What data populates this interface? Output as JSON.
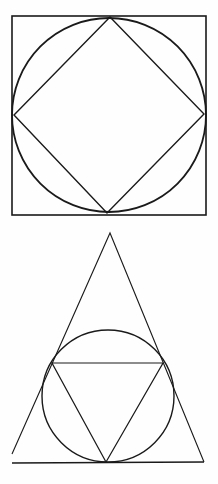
{
  "diagram": {
    "width": 218,
    "height": 484,
    "stroke_color": "#1a1a1a",
    "background": "#fefefe",
    "figures": [
      {
        "name": "square-circle-diamond",
        "description": "Circle inscribed in a square, with a square (diamond) inscribed in the circle",
        "square": {
          "x": 12,
          "y": 16,
          "width": 194,
          "height": 199,
          "stroke_width": 1.6
        },
        "circle": {
          "cx": 109,
          "cy": 115,
          "r": 97,
          "stroke_width": 1.8
        },
        "diamond": {
          "points": [
            [
              110,
              17
            ],
            [
              204,
              114
            ],
            [
              107,
              213
            ],
            [
              14,
              115
            ]
          ],
          "stroke_width": 1.4
        }
      },
      {
        "name": "triangle-circle-triangle",
        "description": "Circle inscribed in a triangle, with an inverted triangle inscribed in the circle",
        "outer_triangle": {
          "apex": [
            110,
            233
          ],
          "left": [
            12,
            454
          ],
          "right": [
            204,
            462
          ],
          "stroke_width": 1.1
        },
        "baseline": {
          "x1": 12,
          "y1": 463,
          "x2": 204,
          "y2": 462,
          "stroke_width": 1.3
        },
        "circle": {
          "cx": 108,
          "cy": 396,
          "r": 66,
          "stroke_width": 1.4
        },
        "inner_triangle": {
          "points": [
            [
              52,
              363
            ],
            [
              163,
              363
            ],
            [
              106,
              462
            ]
          ],
          "stroke_width": 1.2
        }
      }
    ]
  }
}
